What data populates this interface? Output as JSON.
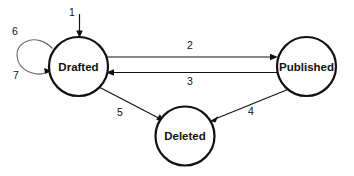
{
  "diagram": {
    "type": "state-transition-diagram",
    "title": "",
    "canvas": {
      "width": 354,
      "height": 176,
      "background": "#ffffff"
    },
    "stroke_color": "#111111",
    "states": [
      {
        "id": "drafted",
        "label": "Drafted",
        "cx": 78.5,
        "cy": 66.5,
        "r": 29.5
      },
      {
        "id": "published",
        "label": "Published",
        "cx": 306.5,
        "cy": 66.5,
        "r": 29.5
      },
      {
        "id": "deleted",
        "label": "Deleted",
        "cx": 185.0,
        "cy": 136.0,
        "r": 29.5
      }
    ],
    "transitions": [
      {
        "id": "t1",
        "label": "1",
        "from": "",
        "to": "drafted",
        "kind": "entry",
        "label_x": 72,
        "label_y": 13
      },
      {
        "id": "t2",
        "label": "2",
        "from": "drafted",
        "to": "published",
        "kind": "straight",
        "label_x": 190,
        "label_y": 46
      },
      {
        "id": "t3",
        "label": "3",
        "from": "published",
        "to": "drafted",
        "kind": "straight",
        "label_x": 190,
        "label_y": 81
      },
      {
        "id": "t4",
        "label": "4",
        "from": "published",
        "to": "deleted",
        "kind": "diagonal",
        "label_x": 251,
        "label_y": 112
      },
      {
        "id": "t5",
        "label": "5",
        "from": "drafted",
        "to": "deleted",
        "kind": "diagonal",
        "label_x": 120,
        "label_y": 113
      },
      {
        "id": "t6",
        "label": "6",
        "from": "drafted",
        "to": "drafted",
        "kind": "self-loop",
        "label_x": 15,
        "label_y": 32
      },
      {
        "id": "t7",
        "label": "7",
        "from": "drafted",
        "to": "drafted",
        "kind": "self-loop",
        "label_x": 16,
        "label_y": 76
      }
    ]
  }
}
